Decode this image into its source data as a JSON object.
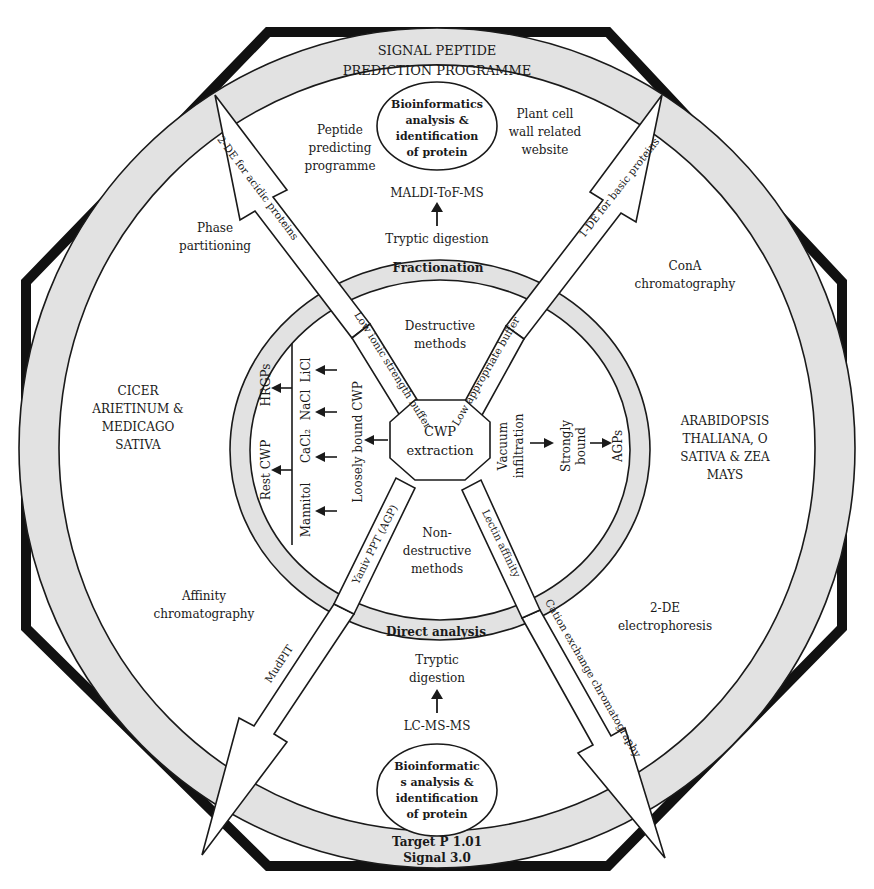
{
  "colors": {
    "ring_fill": "#e2e2e2",
    "stroke": "#1a1a1a",
    "outer_octagon": "#111111",
    "background": "#ffffff"
  },
  "outer_ring": {
    "top": [
      "SIGNAL PEPTIDE",
      "PREDICTION PROGRAMME"
    ],
    "bottom": [
      "Target P 1.01",
      "Signal 3.0"
    ]
  },
  "inner_ring": {
    "top": "Fractionation",
    "bottom": "Direct analysis"
  },
  "center": {
    "lines": [
      "CWP",
      "extraction"
    ]
  },
  "inner_sectors": {
    "top": [
      "Destructive",
      "methods"
    ],
    "bottom": [
      "Non-",
      "destructive",
      "methods"
    ],
    "left": {
      "loosely_bound": "Loosely bound CWP",
      "mannitol": "Mannitol",
      "cacl2": "CaCl₂",
      "nacl": "NaCl",
      "licl": "LiCl",
      "rest_cwp": "Rest CWP",
      "hrgps": "HRGPs"
    },
    "right": {
      "vacuum": [
        "Vacuum",
        "infiltration"
      ],
      "strongly": [
        "Strongly",
        "bound"
      ],
      "agps": "AGPs"
    }
  },
  "top_region": {
    "bioinformatics": [
      "Bioinformatics",
      "analysis &",
      "identification",
      "of protein"
    ],
    "peptide": [
      "Peptide",
      "predicting",
      "programme"
    ],
    "plant_cell": [
      "Plant cell",
      "wall related",
      "website"
    ],
    "maldi": "MALDI-ToF-MS",
    "tryptic": "Tryptic digestion"
  },
  "bottom_region": {
    "tryptic": [
      "Tryptic",
      "digestion"
    ],
    "lcms": "LC-MS-MS",
    "bioinformatics": [
      "Bioinformatic",
      "s analysis &",
      "identification",
      "of protein"
    ]
  },
  "side_regions": {
    "phase": [
      "Phase",
      "partitioning"
    ],
    "cicer": [
      "CICER",
      "ARIETINUM &",
      "MEDICAGO",
      "SATIVA"
    ],
    "affinity": [
      "Affinity",
      "chromatography"
    ],
    "cona": [
      "ConA",
      "chromatography"
    ],
    "arabidopsis": [
      "ARABIDOPSIS",
      "THALIANA, O",
      "SATIVA & ZEA",
      "MAYS"
    ],
    "electrophoresis": [
      "2-DE",
      "electrophoresis"
    ]
  },
  "arrows": {
    "top_left_outer": "2-DE for acidic proteins",
    "top_left_inner": "Low ionic strength buffer",
    "top_right_outer": "1-DE for basic proteins",
    "top_right_inner": "Low appropriate buffer",
    "bottom_left_outer": "MudPIT",
    "bottom_left_inner": "Yaniv PPT (AGP)",
    "bottom_right_outer": "Cation exchange chromatography",
    "bottom_right_inner": "Lectin affinity"
  }
}
